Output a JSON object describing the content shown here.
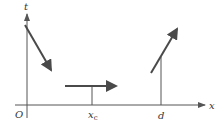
{
  "diagram": {
    "axes": {
      "x_label": "x",
      "y_label": "t",
      "origin_label": "O"
    },
    "markers": {
      "xc_main": "x",
      "xc_sub": "c",
      "d": "d"
    },
    "segments": [
      {
        "name": "descending-worldline",
        "from": [
          25,
          25
        ],
        "to": [
          52,
          72
        ]
      },
      {
        "name": "horizontal-worldline",
        "from": [
          65,
          86
        ],
        "to": [
          118,
          86
        ]
      },
      {
        "name": "ascending-worldline",
        "from": [
          151,
          73
        ],
        "to": [
          178,
          27
        ]
      }
    ],
    "colors": {
      "axis": "#555555",
      "arrow": "#4a4a4a",
      "label": "#333333",
      "background": "#ffffff"
    }
  }
}
